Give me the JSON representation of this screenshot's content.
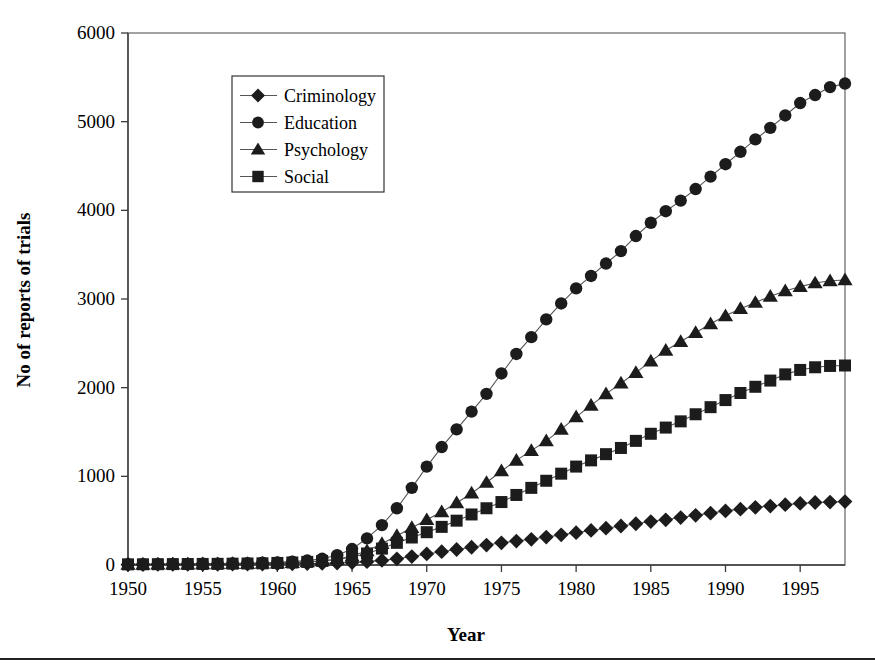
{
  "chart_data": {
    "type": "line",
    "title": "",
    "subtitle": "",
    "xlabel": "Year",
    "ylabel": "No of reports of trials",
    "xlim": [
      1950,
      1998
    ],
    "ylim": [
      0,
      6000
    ],
    "xticks": [
      1950,
      1955,
      1960,
      1965,
      1970,
      1975,
      1980,
      1985,
      1990,
      1995
    ],
    "yticks": [
      0,
      1000,
      2000,
      3000,
      4000,
      5000,
      6000
    ],
    "xtick_labels": [
      "1950",
      "1955",
      "1960",
      "1965",
      "1970",
      "1975",
      "1980",
      "1985",
      "1990",
      "1995"
    ],
    "ytick_labels": [
      "0",
      "1000",
      "2000",
      "3000",
      "4000",
      "5000",
      "6000"
    ],
    "grid": false,
    "legend_position": "upper-left-inside",
    "x": [
      1950,
      1951,
      1952,
      1953,
      1954,
      1955,
      1956,
      1957,
      1958,
      1959,
      1960,
      1961,
      1962,
      1963,
      1964,
      1965,
      1966,
      1967,
      1968,
      1969,
      1970,
      1971,
      1972,
      1973,
      1974,
      1975,
      1976,
      1977,
      1978,
      1979,
      1980,
      1981,
      1982,
      1983,
      1984,
      1985,
      1986,
      1987,
      1988,
      1989,
      1990,
      1991,
      1992,
      1993,
      1994,
      1995,
      1996,
      1997,
      1998
    ],
    "series": [
      {
        "name": "Criminology",
        "marker": "diamond",
        "values": [
          5,
          5,
          6,
          6,
          7,
          8,
          8,
          9,
          10,
          11,
          12,
          14,
          16,
          18,
          22,
          28,
          38,
          52,
          70,
          95,
          125,
          150,
          175,
          200,
          225,
          250,
          270,
          290,
          315,
          340,
          365,
          390,
          415,
          440,
          465,
          490,
          510,
          535,
          560,
          585,
          610,
          630,
          650,
          665,
          680,
          695,
          705,
          710,
          715
        ]
      },
      {
        "name": "Education",
        "marker": "circle",
        "values": [
          8,
          9,
          10,
          11,
          12,
          14,
          16,
          18,
          21,
          25,
          30,
          38,
          50,
          70,
          110,
          180,
          300,
          450,
          640,
          870,
          1110,
          1330,
          1530,
          1730,
          1930,
          2160,
          2380,
          2570,
          2770,
          2950,
          3120,
          3260,
          3400,
          3540,
          3710,
          3860,
          3990,
          4110,
          4240,
          4380,
          4520,
          4660,
          4800,
          4930,
          5070,
          5210,
          5300,
          5390,
          5430
        ]
      },
      {
        "name": "Psychology",
        "marker": "triangle",
        "values": [
          6,
          7,
          8,
          9,
          10,
          11,
          12,
          14,
          16,
          18,
          22,
          27,
          34,
          45,
          65,
          100,
          160,
          240,
          330,
          420,
          510,
          600,
          700,
          810,
          930,
          1060,
          1180,
          1290,
          1400,
          1530,
          1670,
          1800,
          1930,
          2050,
          2170,
          2300,
          2420,
          2520,
          2620,
          2720,
          2810,
          2890,
          2960,
          3030,
          3090,
          3140,
          3180,
          3205,
          3215
        ]
      },
      {
        "name": "Social",
        "marker": "square",
        "values": [
          7,
          8,
          9,
          10,
          11,
          12,
          13,
          15,
          17,
          19,
          23,
          28,
          35,
          46,
          62,
          90,
          130,
          185,
          250,
          310,
          370,
          430,
          500,
          570,
          640,
          710,
          790,
          870,
          950,
          1030,
          1110,
          1180,
          1250,
          1320,
          1400,
          1480,
          1550,
          1620,
          1700,
          1780,
          1860,
          1940,
          2010,
          2080,
          2150,
          2200,
          2230,
          2245,
          2250
        ]
      }
    ]
  },
  "legend": {
    "items": [
      {
        "label": "Criminology",
        "marker": "diamond"
      },
      {
        "label": "Education",
        "marker": "circle"
      },
      {
        "label": "Psychology",
        "marker": "triangle"
      },
      {
        "label": "Social",
        "marker": "square"
      }
    ]
  },
  "colors": {
    "marker": "#1c1c1c",
    "line": "#555555",
    "axis": "#3a3a3a",
    "background": "#ffffff"
  }
}
